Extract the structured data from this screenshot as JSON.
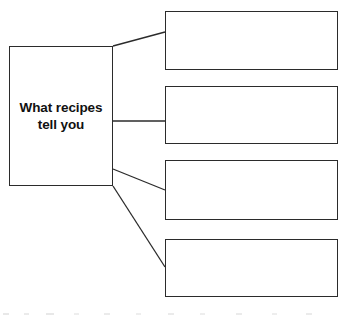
{
  "diagram": {
    "type": "graphic-organizer",
    "orientation": "horizontal-tree",
    "canvas": {
      "width": 351,
      "height": 322
    },
    "style": {
      "background_color": "#ffffff",
      "stroke_color": "#2b2b2b",
      "text_color": "#111111"
    },
    "main_node": {
      "label": "What recipes tell you",
      "bold": true,
      "x": 9,
      "y": 46,
      "width": 104,
      "height": 140
    },
    "detail_nodes": [
      {
        "id": 1,
        "label": "",
        "x": 165,
        "y": 11,
        "width": 173,
        "height": 59
      },
      {
        "id": 2,
        "label": "",
        "x": 165,
        "y": 86,
        "width": 173,
        "height": 58
      },
      {
        "id": 3,
        "label": "",
        "x": 165,
        "y": 160,
        "width": 173,
        "height": 60
      },
      {
        "id": 4,
        "label": "",
        "x": 165,
        "y": 239,
        "width": 173,
        "height": 58
      }
    ],
    "connectors": [
      {
        "id": 1,
        "from_x": 113,
        "from_y": 46,
        "to_x": 165,
        "to_y": 32
      },
      {
        "id": 2,
        "from_x": 113,
        "from_y": 121,
        "to_x": 165,
        "to_y": 121
      },
      {
        "id": 3,
        "from_x": 113,
        "from_y": 169,
        "to_x": 165,
        "to_y": 190
      },
      {
        "id": 4,
        "from_x": 113,
        "from_y": 186,
        "to_x": 165,
        "to_y": 267
      }
    ]
  }
}
